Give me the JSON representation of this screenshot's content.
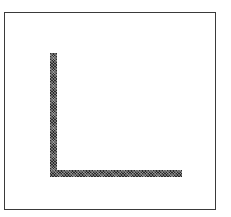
{
  "figure": {
    "kind": "line-art-figure",
    "caption": "",
    "background_color": "#ffffff",
    "frame": {
      "name": "figure-border",
      "stroke_color": "#3a3a3a",
      "stroke_width_px": 1,
      "x": 4,
      "y": 12,
      "width": 212,
      "height": 198
    },
    "shape": {
      "name": "L",
      "description": "Large capital-L / right-angle bracket drawn with thick dithered strokes",
      "fill_color": "#2b2b2b",
      "texture": "dithered",
      "stroke_thickness_px": 7,
      "origin_x": 50,
      "origin_y": 53,
      "vertical_limb": {
        "label": "vertical-stroke",
        "x": 0,
        "y": 0,
        "width": 7,
        "height": 124
      },
      "horizontal_limb": {
        "label": "horizontal-stroke",
        "x": 0,
        "y": 117,
        "width": 132,
        "height": 7
      }
    }
  }
}
